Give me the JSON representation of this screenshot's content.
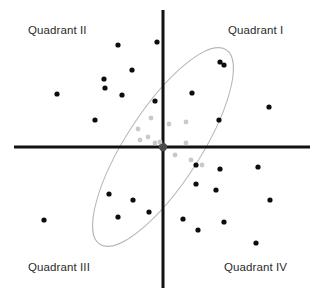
{
  "figure": {
    "width": 322,
    "height": 295,
    "background_color": "#ffffff"
  },
  "labels": {
    "quadrant_1": "Quadrant I",
    "quadrant_2": "Quadrant II",
    "quadrant_3": "Quadrant III",
    "quadrant_4": "Quadrant IV",
    "text_color": "#2b2b2b"
  },
  "chart_data": {
    "type": "scatter",
    "title": "",
    "xlabel": "",
    "ylabel": "",
    "xlim": [
      -163,
      159
    ],
    "ylim": [
      -148,
      147
    ],
    "grid": false,
    "legend": null,
    "annotations": [
      "Quadrant I",
      "Quadrant II",
      "Quadrant III",
      "Quadrant IV"
    ],
    "axes": {
      "origin": [
        163,
        147
      ],
      "x_axis": {
        "x1": 14,
        "y1": 147,
        "x2": 310,
        "y2": 147,
        "color": "#111111",
        "width": 3
      },
      "y_axis": {
        "x1": 163,
        "y1": 10,
        "x2": 163,
        "y2": 288,
        "color": "#111111",
        "width": 3
      },
      "origin_marker": {
        "cx": 163,
        "cy": 147,
        "r": 4.2,
        "color": "#4a4a4a"
      }
    },
    "ellipse": {
      "cx": 163,
      "cy": 147,
      "rx": 116,
      "ry": 37,
      "rotation_deg": -57,
      "stroke": "#b6b6b6",
      "stroke_width": 1,
      "fill": "none"
    },
    "series": [
      {
        "name": "outer-points",
        "color": "#0d0d0d",
        "radius": 2.6,
        "points": [
          [
            118,
            45
          ],
          [
            157,
            42
          ],
          [
            132,
            70
          ],
          [
            104,
            79
          ],
          [
            105,
            88
          ],
          [
            57,
            94
          ],
          [
            122,
            95
          ],
          [
            155,
            101
          ],
          [
            95,
            120
          ],
          [
            224,
            65
          ],
          [
            192,
            93
          ],
          [
            219,
            120
          ],
          [
            269,
            107
          ],
          [
            109,
            194
          ],
          [
            133,
            200
          ],
          [
            118,
            217
          ],
          [
            149,
            212
          ],
          [
            44,
            220
          ],
          [
            220,
            62
          ],
          [
            196,
            165
          ],
          [
            220,
            169
          ],
          [
            258,
            167
          ],
          [
            196,
            184
          ],
          [
            216,
            190
          ],
          [
            270,
            200
          ],
          [
            183,
            219
          ],
          [
            224,
            222
          ],
          [
            198,
            230
          ],
          [
            256,
            243
          ]
        ]
      },
      {
        "name": "inner-cluster-points",
        "color": "#c9c9c9",
        "radius": 2.4,
        "points": [
          [
            138,
            129
          ],
          [
            148,
            137
          ],
          [
            140,
            140
          ],
          [
            155,
            143
          ],
          [
            186,
            122
          ],
          [
            169,
            124
          ],
          [
            186,
            143
          ],
          [
            175,
            155
          ],
          [
            191,
            160
          ],
          [
            202,
            165
          ],
          [
            151,
            118
          ],
          [
            160,
            142
          ]
        ]
      }
    ]
  }
}
